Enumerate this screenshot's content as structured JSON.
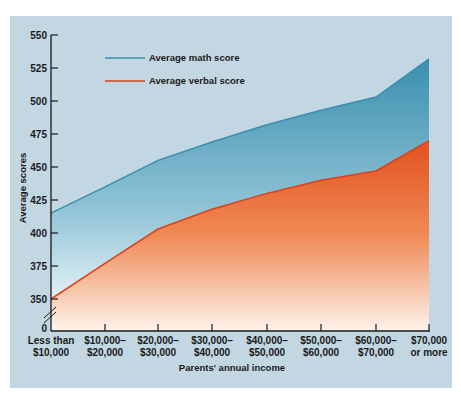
{
  "chart_data": {
    "type": "area",
    "title": "",
    "xlabel": "Parents' annual income",
    "ylabel": "Average scores",
    "categories": [
      [
        "Less than",
        "$10,000"
      ],
      [
        "$10,000–",
        "$20,000"
      ],
      [
        "$20,000–",
        "$30,000"
      ],
      [
        "$30,000–",
        "$40,000"
      ],
      [
        "$40,000–",
        "$50,000"
      ],
      [
        "$50,000–",
        "$60,000"
      ],
      [
        "$60,000–",
        "$70,000"
      ],
      [
        "$70,000",
        "or more"
      ]
    ],
    "series": [
      {
        "name": "Average math score",
        "color": "#3a8fae",
        "values": [
          415,
          435,
          455,
          469,
          482,
          493,
          503,
          532
        ]
      },
      {
        "name": "Average verbal score",
        "color": "#d9421c",
        "values": [
          350,
          377,
          403,
          418,
          430,
          440,
          447,
          470
        ]
      }
    ],
    "yticks": [
      550,
      525,
      500,
      475,
      450,
      425,
      400,
      375,
      350,
      0
    ],
    "ylim": [
      350,
      550
    ],
    "y_axis_break": true,
    "grid": false,
    "legend_position": "top-left-inside"
  },
  "legend": {
    "math_label": "Average math score",
    "verbal_label": "Average verbal score"
  },
  "axes": {
    "x_title": "Parents' annual income",
    "y_title": "Average scores"
  }
}
